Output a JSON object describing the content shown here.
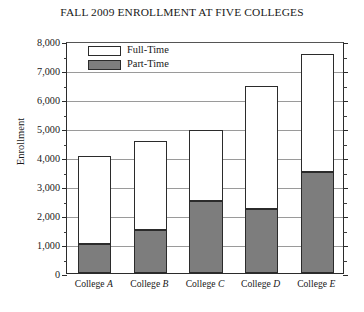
{
  "chart_data": {
    "type": "bar",
    "subtype": "stacked-column",
    "title": "FALL 2009 ENROLLMENT AT FIVE COLLEGES",
    "xlabel": "",
    "ylabel": "Enrollment",
    "categories": [
      "College A",
      "College B",
      "College C",
      "College D",
      "College E"
    ],
    "category_prefix": "College",
    "category_suffixes": [
      "A",
      "B",
      "C",
      "D",
      "E"
    ],
    "series": [
      {
        "name": "Part-Time",
        "color": "#7d7d7d",
        "values": [
          1000,
          1500,
          2500,
          2200,
          3500
        ]
      },
      {
        "name": "Full-Time",
        "color": "#ffffff",
        "values": [
          3000,
          3000,
          2400,
          4200,
          4000
        ]
      }
    ],
    "totals": [
      4000,
      4500,
      4900,
      6400,
      7500
    ],
    "ylim": [
      0,
      8000
    ],
    "ytick_values": [
      0,
      1000,
      2000,
      3000,
      4000,
      5000,
      6000,
      7000,
      8000
    ],
    "ytick_labels": [
      "0",
      "1,000",
      "2,000",
      "3,000",
      "4,000",
      "5,000",
      "6,000",
      "7,000",
      "8,000"
    ],
    "yminor_values": [
      500,
      1500,
      2500,
      3500,
      4500,
      5500,
      6500,
      7500
    ],
    "grid": true,
    "grid_axis": "y",
    "legend_position": "upper-left-inside",
    "legend_entries": [
      "Full-Time",
      "Part-Time"
    ],
    "stack_order_bottom_to_top": [
      "Part-Time",
      "Full-Time"
    ]
  },
  "legend": {
    "items": [
      {
        "label": "Full-Time",
        "swatch": "white-swatch"
      },
      {
        "label": "Part-Time",
        "swatch": "gray-swatch"
      }
    ]
  },
  "colors": {
    "part_time_fill": "#7d7d7d",
    "full_time_fill": "#ffffff",
    "outline": "#2b2b2b",
    "gridline": "#9a9a9a",
    "background": "#ffffff",
    "text": "#181818"
  }
}
